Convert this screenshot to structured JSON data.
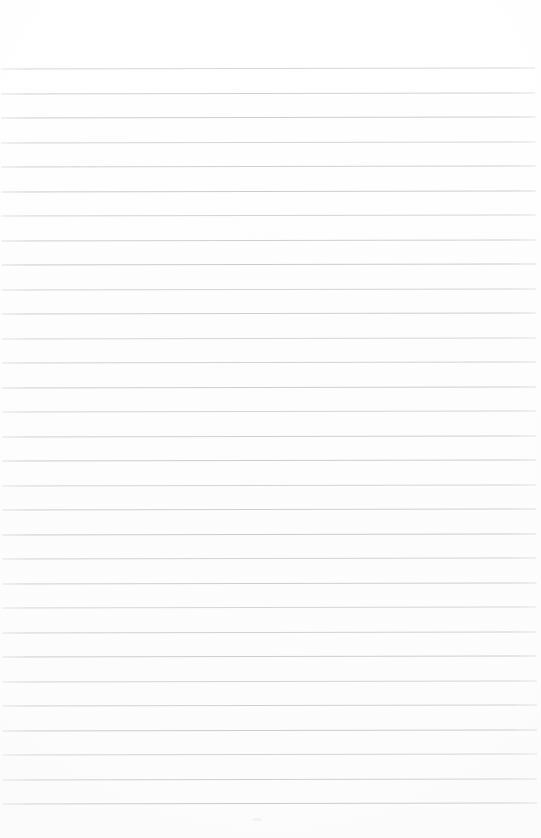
{
  "document": {
    "kind": "scanned-lined-paper",
    "title": "Blank Lined Paper",
    "page_width": 541,
    "page_height": 838,
    "background_color": "#fdfdfd",
    "has_visible_text": false,
    "body_text": "",
    "header_text": "",
    "footer_text": "",
    "page_number_text": "",
    "margin_note_text": ""
  },
  "ruling": {
    "line_color": "#c9cbcf",
    "line_thickness_px": 1,
    "line_count": 31,
    "first_line_y": 68,
    "line_spacing_px": 24.5,
    "line_start_x": 2,
    "line_end_x": 536,
    "skew_degrees": -0.12,
    "vertical_margin_rule": false,
    "top_margin_px": 68,
    "bottom_margin_px": 26,
    "line_y_positions": [
      68,
      92.5,
      117,
      141.5,
      166,
      190.5,
      215,
      239.5,
      264,
      288.5,
      313,
      337.5,
      362,
      386.5,
      411,
      435.5,
      460,
      484.5,
      509,
      533.5,
      558,
      582.5,
      607,
      631.5,
      656,
      680.5,
      705,
      729.5,
      754,
      778.5,
      803
    ]
  },
  "artifacts": {
    "speckle_present": true,
    "vignette_present": true
  }
}
